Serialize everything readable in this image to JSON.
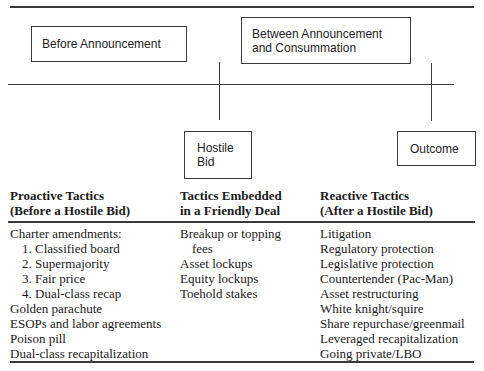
{
  "timeline": {
    "phase_before": "Before Announcement",
    "phase_between_line1": "Between Announcement",
    "phase_between_line2": "and Consummation",
    "event_hostile_bid_line1": "Hostile",
    "event_hostile_bid_line2": "Bid",
    "event_outcome": "Outcome"
  },
  "columns": [
    {
      "header_line1": "Proactive Tactics",
      "header_line2": "(Before a Hostile Bid)",
      "items": [
        {
          "text": "Charter amendments:",
          "indent": false
        },
        {
          "text": "1. Classified board",
          "indent": true
        },
        {
          "text": "2. Supermajority",
          "indent": true
        },
        {
          "text": "3. Fair price",
          "indent": true
        },
        {
          "text": "4. Dual-class recap",
          "indent": true
        },
        {
          "text": "Golden parachute",
          "indent": false
        },
        {
          "text": "ESOPs and labor agreements",
          "indent": false
        },
        {
          "text": "Poison pill",
          "indent": false
        },
        {
          "text": "Dual-class recapitalization",
          "indent": false
        }
      ]
    },
    {
      "header_line1": "Tactics Embedded",
      "header_line2": "in a Friendly Deal",
      "items": [
        {
          "text": "Breakup or topping",
          "indent": false
        },
        {
          "text": "fees",
          "indent": true
        },
        {
          "text": "Asset lockups",
          "indent": false
        },
        {
          "text": "Equity lockups",
          "indent": false
        },
        {
          "text": "Toehold stakes",
          "indent": false
        }
      ]
    },
    {
      "header_line1": "Reactive Tactics",
      "header_line2": "(After a Hostile Bid)",
      "items": [
        {
          "text": "Litigation",
          "indent": false
        },
        {
          "text": "Regulatory protection",
          "indent": false
        },
        {
          "text": "Legislative protection",
          "indent": false
        },
        {
          "text": "Countertender (Pac-Man)",
          "indent": false
        },
        {
          "text": "Asset restructuring",
          "indent": false
        },
        {
          "text": "White knight/squire",
          "indent": false
        },
        {
          "text": "Share repurchase/greenmail",
          "indent": false
        },
        {
          "text": "Leveraged recapitalization",
          "indent": false
        },
        {
          "text": "Going private/LBO",
          "indent": false
        }
      ]
    }
  ]
}
